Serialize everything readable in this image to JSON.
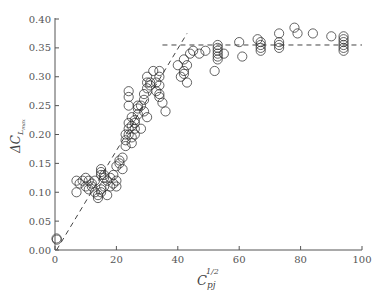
{
  "chart_data": {
    "type": "scatter",
    "title": "",
    "xlabel": "C_pj^{1/2}",
    "ylabel": "ΔC_{L_max}",
    "xlabel_main": "C",
    "xlabel_sub": "pj",
    "xlabel_sup": "1/2",
    "ylabel_main": "ΔC",
    "ylabel_sub": "L",
    "ylabel_subsub": "max",
    "xlim": [
      0,
      100
    ],
    "ylim": [
      0.0,
      0.4
    ],
    "xticks": [
      0,
      20,
      40,
      60,
      80,
      100
    ],
    "xtick_labels": [
      "0",
      "20",
      "40",
      "60",
      "80",
      "100"
    ],
    "yticks": [
      0.0,
      0.05,
      0.1,
      0.15,
      0.2,
      0.25,
      0.3,
      0.35,
      0.4
    ],
    "ytick_labels": [
      "0.00",
      "0.05",
      "0.10",
      "0.15",
      "0.20",
      "0.25",
      "0.30",
      "0.35",
      "0.40"
    ],
    "grid": false,
    "legend": null,
    "marker": "open-circle",
    "series": [
      {
        "name": "experimental data",
        "points": [
          [
            0.5,
            0.02
          ],
          [
            0.6,
            0.018
          ],
          [
            7,
            0.1
          ],
          [
            7,
            0.12
          ],
          [
            8,
            0.115
          ],
          [
            9,
            0.12
          ],
          [
            10,
            0.125
          ],
          [
            10,
            0.11
          ],
          [
            11,
            0.12
          ],
          [
            11,
            0.105
          ],
          [
            12,
            0.115
          ],
          [
            12,
            0.11
          ],
          [
            13,
            0.1
          ],
          [
            13,
            0.12
          ],
          [
            14,
            0.09
          ],
          [
            14,
            0.095
          ],
          [
            15,
            0.1
          ],
          [
            15,
            0.105
          ],
          [
            15,
            0.13
          ],
          [
            15,
            0.135
          ],
          [
            15,
            0.14
          ],
          [
            16,
            0.11
          ],
          [
            16,
            0.125
          ],
          [
            16,
            0.13
          ],
          [
            17,
            0.12
          ],
          [
            17,
            0.095
          ],
          [
            18,
            0.11
          ],
          [
            18,
            0.125
          ],
          [
            19,
            0.13
          ],
          [
            19,
            0.115
          ],
          [
            20,
            0.12
          ],
          [
            20,
            0.11
          ],
          [
            20,
            0.145
          ],
          [
            21,
            0.15
          ],
          [
            21,
            0.155
          ],
          [
            22,
            0.14
          ],
          [
            22,
            0.16
          ],
          [
            23,
            0.18
          ],
          [
            23,
            0.19
          ],
          [
            23,
            0.2
          ],
          [
            24,
            0.2
          ],
          [
            24,
            0.21
          ],
          [
            24,
            0.22
          ],
          [
            24,
            0.25
          ],
          [
            24,
            0.265
          ],
          [
            24,
            0.275
          ],
          [
            25,
            0.185
          ],
          [
            25,
            0.195
          ],
          [
            25,
            0.215
          ],
          [
            25,
            0.23
          ],
          [
            26,
            0.2
          ],
          [
            26,
            0.21
          ],
          [
            26,
            0.22
          ],
          [
            26,
            0.225
          ],
          [
            27,
            0.235
          ],
          [
            27,
            0.245
          ],
          [
            27,
            0.25
          ],
          [
            28,
            0.25
          ],
          [
            28,
            0.21
          ],
          [
            29,
            0.24
          ],
          [
            29,
            0.26
          ],
          [
            29,
            0.27
          ],
          [
            30,
            0.28
          ],
          [
            30,
            0.29
          ],
          [
            30,
            0.3
          ],
          [
            30,
            0.23
          ],
          [
            31,
            0.29
          ],
          [
            31,
            0.285
          ],
          [
            32,
            0.31
          ],
          [
            33,
            0.275
          ],
          [
            33,
            0.29
          ],
          [
            34,
            0.3
          ],
          [
            34,
            0.27
          ],
          [
            34,
            0.285
          ],
          [
            34,
            0.31
          ],
          [
            34,
            0.265
          ],
          [
            35,
            0.255
          ],
          [
            36,
            0.24
          ],
          [
            40,
            0.32
          ],
          [
            41,
            0.3
          ],
          [
            42,
            0.305
          ],
          [
            42,
            0.31
          ],
          [
            42,
            0.33
          ],
          [
            43,
            0.32
          ],
          [
            43,
            0.29
          ],
          [
            44,
            0.34
          ],
          [
            45,
            0.345
          ],
          [
            47,
            0.34
          ],
          [
            49,
            0.345
          ],
          [
            52,
            0.31
          ],
          [
            53,
            0.33
          ],
          [
            53,
            0.335
          ],
          [
            53,
            0.34
          ],
          [
            53,
            0.345
          ],
          [
            53,
            0.35
          ],
          [
            53,
            0.355
          ],
          [
            55,
            0.34
          ],
          [
            60,
            0.36
          ],
          [
            61,
            0.335
          ],
          [
            66,
            0.365
          ],
          [
            67,
            0.345
          ],
          [
            67,
            0.35
          ],
          [
            67,
            0.355
          ],
          [
            67,
            0.36
          ],
          [
            73,
            0.35
          ],
          [
            73,
            0.355
          ],
          [
            73,
            0.36
          ],
          [
            73,
            0.375
          ],
          [
            78,
            0.385
          ],
          [
            79,
            0.375
          ],
          [
            84,
            0.375
          ],
          [
            90,
            0.37
          ],
          [
            94,
            0.345
          ],
          [
            94,
            0.35
          ],
          [
            94,
            0.355
          ],
          [
            94,
            0.36
          ],
          [
            94,
            0.365
          ],
          [
            94,
            0.37
          ]
        ]
      }
    ],
    "reference_lines": [
      {
        "name": "linear-trend",
        "style": "dashed",
        "x": [
          0.5,
          43
        ],
        "y": [
          0.0,
          0.375
        ]
      },
      {
        "name": "plateau",
        "style": "dashed",
        "x": [
          35,
          100
        ],
        "y": [
          0.355,
          0.355
        ]
      }
    ]
  }
}
